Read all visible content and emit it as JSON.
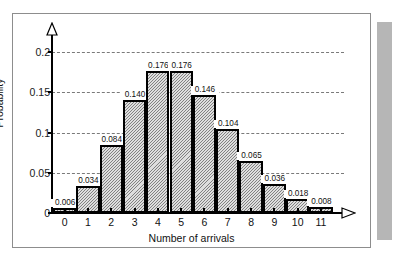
{
  "chart_data": {
    "type": "bar",
    "title": "",
    "subtitle": "",
    "xlabel": "Number of arrivals",
    "ylabel": "Probability",
    "categories": [
      "0",
      "1",
      "2",
      "3",
      "4",
      "5",
      "6",
      "7",
      "8",
      "9",
      "10",
      "11"
    ],
    "values": [
      0.006,
      0.034,
      0.084,
      0.14,
      0.176,
      0.176,
      0.146,
      0.104,
      0.065,
      0.036,
      0.018,
      0.008
    ],
    "value_labels": [
      "0.006",
      "0.034",
      "0.084",
      "0.140",
      "0.176",
      "0.176",
      "0.146",
      "0.104",
      "0.065",
      "0.036",
      "0.018",
      "0.008"
    ],
    "ylim": [
      0,
      0.21
    ],
    "xlim": [
      0,
      12
    ],
    "ytick_values": [
      0,
      0.05,
      0.1,
      0.15,
      0.2
    ],
    "ytick_labels": [
      "0",
      "0.05",
      "0.1",
      "0.15",
      "0.2"
    ],
    "grid": true,
    "grid_style": "dashed-horizontal",
    "legend": null,
    "legend_position": "none",
    "bar_fill": "#dedede",
    "bar_edge": "#000000",
    "grid_color": "#7a7a7a",
    "axis_color": "#000000",
    "axis_arrows": [
      "y-up",
      "x-right"
    ],
    "frame_color": "#8d8d8d",
    "shadow_color": "#b6b6b6"
  }
}
